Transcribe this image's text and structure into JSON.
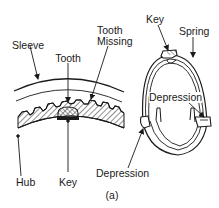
{
  "figure": {
    "caption": "(a)",
    "colors": {
      "line": "#1a1a1a",
      "background": "#ffffff",
      "hatch": "#333333"
    }
  },
  "left_diagram": {
    "name": "synchronizer-sleeve-hub-cross-section",
    "labels": {
      "sleeve": "Sleeve",
      "tooth": "Tooth",
      "tooth_missing_line1": "Tooth",
      "tooth_missing_line2": "Missing",
      "hub": "Hub",
      "key": "Key"
    }
  },
  "right_diagram": {
    "name": "synchronizer-spring-ring",
    "labels": {
      "key": "Key",
      "spring": "Spring",
      "depression_top": "Depression",
      "depression_bottom": "Depression"
    }
  }
}
